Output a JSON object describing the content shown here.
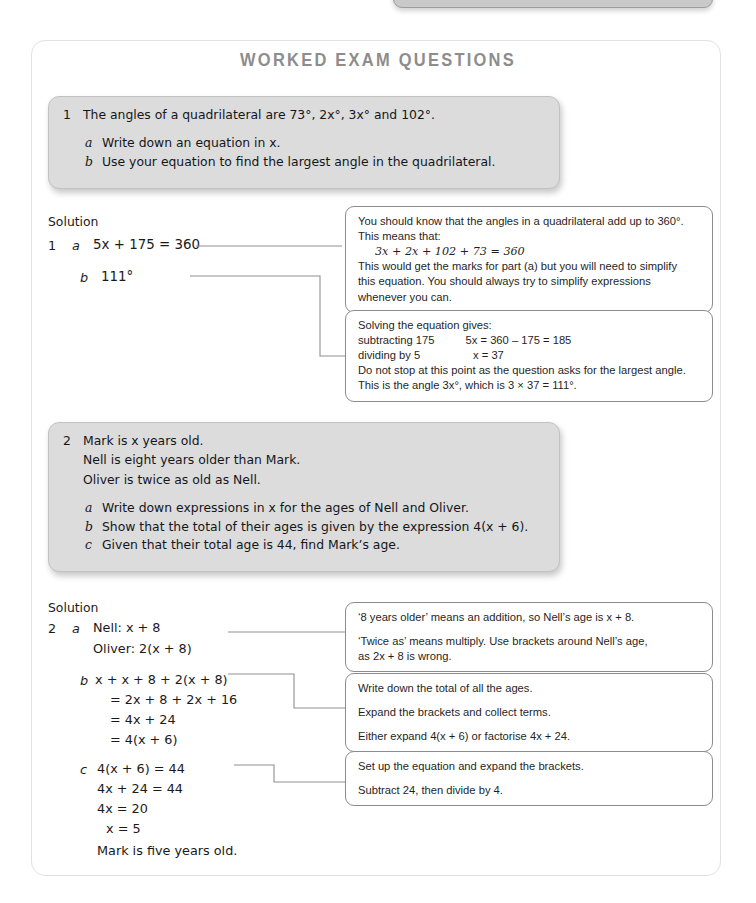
{
  "page": {
    "title": "WORKED EXAM QUESTIONS",
    "solution_label_1": "Solution",
    "solution_label_2": "Solution"
  },
  "question1": {
    "number": "1",
    "stem": "The angles of a quadrilateral are 73°, 2x°, 3x° and 102°.",
    "parts": [
      {
        "label": "a",
        "text": "Write down an equation in x."
      },
      {
        "label": "b",
        "text": "Use your equation to find the largest angle in the quadrilateral."
      }
    ],
    "solution": {
      "number": "1",
      "lines": [
        {
          "label": "a",
          "text": "5x + 175 = 360"
        },
        {
          "label": "b",
          "text": "111°"
        }
      ]
    },
    "notes": [
      {
        "lines": [
          "You should know that the angles in a quadrilateral add up to 360°.",
          "This means that:",
          "3x + 2x + 102 + 73 = 360",
          "This would get the marks for part (a) but you will need to simplify",
          "this equation. You should always try to simplify expressions",
          "whenever you can."
        ]
      },
      {
        "lines": [
          "Solving the equation gives:",
          "subtracting 175          5x = 360 – 175 = 185",
          "dividing by 5                 x = 37",
          "Do not stop at this point as the question asks for the largest angle.",
          "This is the angle 3x°, which is 3 × 37 = 111°."
        ]
      }
    ]
  },
  "question2": {
    "number": "2",
    "stem_lines": [
      "Mark is x years old.",
      "Nell is eight years older than Mark.",
      "Oliver is twice as old as Nell."
    ],
    "parts": [
      {
        "label": "a",
        "text": "Write down expressions in x for the ages of Nell and Oliver."
      },
      {
        "label": "b",
        "text": "Show that the total of their ages is given by the expression 4(x + 6)."
      },
      {
        "label": "c",
        "text": "Given that their total age is 44, find Mark’s age."
      }
    ],
    "solution": {
      "number": "2",
      "part_a": {
        "label": "a",
        "lines": [
          "Nell: x + 8",
          "Oliver: 2(x + 8)"
        ]
      },
      "part_b": {
        "label": "b",
        "lines": [
          "x + x + 8 + 2(x + 8)",
          "=  2x + 8 + 2x + 16",
          "=  4x + 24",
          "=  4(x + 6)"
        ]
      },
      "part_c": {
        "label": "c",
        "lines": [
          "4(x + 6) = 44",
          "4x + 24 = 44",
          "4x = 20",
          "x = 5",
          "Mark is five years old."
        ]
      }
    },
    "notes": [
      {
        "lines": [
          "‘8 years older’ means an addition, so Nell’s age is x + 8.",
          "‘Twice as’ means multiply. Use brackets around Nell’s age,",
          "as 2x + 8 is wrong."
        ]
      },
      {
        "lines": [
          "Write down the total of all the ages.",
          "Expand the brackets and collect terms.",
          "Either expand 4(x + 6) or factorise 4x + 24."
        ]
      },
      {
        "lines": [
          "Set up the equation and expand the brackets.",
          "Subtract 24, then divide by 4."
        ]
      }
    ]
  },
  "colors": {
    "title": "#8d8d8d",
    "question_panel": "#dcdcdc",
    "note_border": "#8c8c8c",
    "connector": "#8f8f8f",
    "page_border": "#e2e2e2"
  }
}
